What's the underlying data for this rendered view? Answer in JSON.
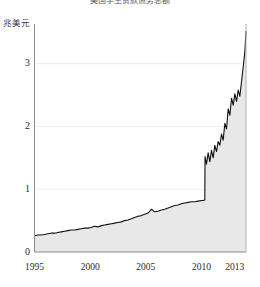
{
  "chart_data": {
    "type": "area",
    "title": "美国学生贷款债务总额",
    "ylabel": "兆美元",
    "xlabel": "",
    "ylim": [
      0,
      3.6
    ],
    "xlim": [
      1995,
      2014.0
    ],
    "grid": true,
    "legend": null,
    "y_ticks": [
      "0",
      "1",
      "2",
      "3"
    ],
    "y_tick_values": [
      0,
      1,
      2,
      3
    ],
    "x_ticks": [
      "1995",
      "2000",
      "2005",
      "2010",
      "2013"
    ],
    "x_tick_values": [
      1995,
      2000,
      2005,
      2010,
      2013
    ],
    "line_color": "#111111",
    "fill_color": "#e6e6e6",
    "axis_color": "#808080",
    "grid_color": "#ededed",
    "x": [
      1995.0,
      1995.3,
      1995.6,
      1995.9,
      1996.2,
      1996.5,
      1996.8,
      1997.1,
      1997.4,
      1997.7,
      1998.0,
      1998.3,
      1998.6,
      1998.9,
      1999.2,
      1999.5,
      1999.8,
      2000.1,
      2000.4,
      2000.7,
      2001.0,
      2001.3,
      2001.6,
      2001.9,
      2002.2,
      2002.5,
      2002.8,
      2003.1,
      2003.4,
      2003.7,
      2004.0,
      2004.3,
      2004.6,
      2004.9,
      2005.2,
      2005.5,
      2005.8,
      2006.1,
      2006.4,
      2006.7,
      2007.0,
      2007.3,
      2007.6,
      2007.9,
      2008.2,
      2008.5,
      2008.8,
      2009.1,
      2009.4,
      2009.7,
      2010.0,
      2010.15,
      2010.3,
      2010.32,
      2010.45,
      2010.6,
      2010.75,
      2010.9,
      2011.05,
      2011.2,
      2011.35,
      2011.5,
      2011.65,
      2011.8,
      2011.95,
      2012.1,
      2012.25,
      2012.4,
      2012.55,
      2012.7,
      2012.85,
      2013.0,
      2013.15,
      2013.3,
      2013.45,
      2013.6,
      2013.75,
      2013.9,
      2014.0
    ],
    "values": [
      0.26,
      0.27,
      0.27,
      0.28,
      0.29,
      0.3,
      0.3,
      0.31,
      0.32,
      0.33,
      0.34,
      0.35,
      0.35,
      0.36,
      0.37,
      0.38,
      0.38,
      0.39,
      0.41,
      0.4,
      0.42,
      0.43,
      0.44,
      0.45,
      0.46,
      0.47,
      0.48,
      0.5,
      0.51,
      0.53,
      0.55,
      0.57,
      0.58,
      0.6,
      0.62,
      0.68,
      0.64,
      0.65,
      0.67,
      0.68,
      0.7,
      0.72,
      0.74,
      0.75,
      0.77,
      0.78,
      0.79,
      0.8,
      0.8,
      0.81,
      0.82,
      0.82,
      0.83,
      1.52,
      1.4,
      1.58,
      1.44,
      1.62,
      1.5,
      1.7,
      1.6,
      1.76,
      1.7,
      1.88,
      1.78,
      2.05,
      1.96,
      2.28,
      2.18,
      2.45,
      2.34,
      2.52,
      2.4,
      2.58,
      2.48,
      2.72,
      2.95,
      3.2,
      3.52
    ]
  }
}
